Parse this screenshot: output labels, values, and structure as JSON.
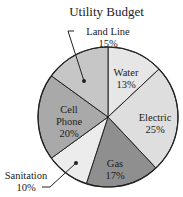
{
  "chart_data": {
    "type": "pie",
    "title": "Utility Budget",
    "categories": [
      "Water",
      "Electric",
      "Gas",
      "Sanitation",
      "Cell Phone",
      "Land Line"
    ],
    "values": [
      13,
      25,
      17,
      10,
      20,
      15
    ],
    "unit": "%",
    "start_angle": "12 o'clock",
    "direction": "clockwise",
    "slices": [
      {
        "label": "Water",
        "value": 13,
        "color": "#e6e6e6",
        "label_line1": "Water",
        "label_line2": "13%"
      },
      {
        "label": "Electric",
        "value": 25,
        "color": "#dedede",
        "label_line1": "Electric",
        "label_line2": "25%"
      },
      {
        "label": "Gas",
        "value": 17,
        "color": "#8f8f8f",
        "label_line1": "Gas",
        "label_line2": "17%"
      },
      {
        "label": "Sanitation",
        "value": 10,
        "color": "#ececec",
        "label_line1": "Sanitation",
        "label_line2": "10%"
      },
      {
        "label": "Cell Phone",
        "value": 20,
        "color": "#a9a9a9",
        "label_line1": "Cell",
        "label_line2": "Phone",
        "label_line3": "20%"
      },
      {
        "label": "Land Line",
        "value": 15,
        "color": "#c6c6c6",
        "label_line1": "Land Line",
        "label_line2": "15%"
      }
    ],
    "legend": "none (callout labels)"
  }
}
